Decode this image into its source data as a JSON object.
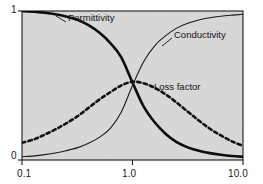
{
  "figure": {
    "width": 263,
    "height": 184,
    "outer_background": "#ffffff",
    "plot_background": "#d8d8d8",
    "frame_color": "#1b1b1b"
  },
  "chart_data": {
    "type": "line",
    "title": "",
    "xlabel": "",
    "ylabel": "",
    "xscale": "log",
    "xlim": [
      0.1,
      10.0
    ],
    "ylim": [
      0,
      1
    ],
    "grid": false,
    "legend_position": "inline-annotations",
    "x_tick_labels": [
      "0.1",
      "1.0",
      "10.0"
    ],
    "x_tick_values": [
      0.1,
      1.0,
      10.0
    ],
    "y_tick_labels": [
      "0",
      "1"
    ],
    "y_tick_values": [
      0,
      1
    ],
    "x": [
      0.1,
      0.13,
      0.16,
      0.2,
      0.25,
      0.32,
      0.4,
      0.5,
      0.63,
      0.79,
      1.0,
      1.26,
      1.58,
      2.0,
      2.51,
      3.16,
      3.98,
      5.01,
      6.31,
      7.94,
      10.0
    ],
    "series": [
      {
        "name": "Permittivity",
        "style": "solid",
        "width": 2.6,
        "color": "#0d0d0d",
        "label_x": 0.38,
        "label_y": 0.94,
        "values": [
          1.0,
          0.995,
          0.988,
          0.978,
          0.963,
          0.94,
          0.905,
          0.855,
          0.785,
          0.69,
          0.52,
          0.36,
          0.255,
          0.175,
          0.12,
          0.085,
          0.062,
          0.046,
          0.035,
          0.027,
          0.022
        ]
      },
      {
        "name": "Conductivity",
        "style": "solid",
        "width": 1.1,
        "color": "#1b1b1b",
        "label_x": 3.2,
        "label_y": 0.83,
        "values": [
          0.022,
          0.028,
          0.036,
          0.047,
          0.062,
          0.083,
          0.112,
          0.152,
          0.212,
          0.32,
          0.5,
          0.66,
          0.765,
          0.835,
          0.885,
          0.918,
          0.94,
          0.955,
          0.965,
          0.972,
          0.978
        ]
      },
      {
        "name": "Loss factor",
        "style": "dashed",
        "width": 2.6,
        "color": "#111111",
        "label_x": 2.1,
        "label_y": 0.52,
        "values": [
          0.115,
          0.14,
          0.17,
          0.205,
          0.245,
          0.295,
          0.35,
          0.405,
          0.455,
          0.5,
          0.525,
          0.515,
          0.485,
          0.44,
          0.385,
          0.325,
          0.265,
          0.21,
          0.165,
          0.125,
          0.095
        ]
      }
    ]
  },
  "axes": {
    "y_top_label": "1",
    "y_bottom_label": "0",
    "x_labels": [
      "0.1",
      "1.0",
      "10.0"
    ]
  },
  "annotations": {
    "permittivity": "Permittivity",
    "conductivity": "Conductivity",
    "loss_factor": "Loss factor"
  }
}
